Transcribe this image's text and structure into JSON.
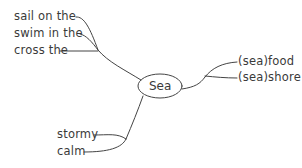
{
  "diagram": {
    "type": "mind-map",
    "center": "Sea",
    "branches": {
      "top_left": [
        "sail on the",
        "swim in the",
        "cross the"
      ],
      "right": [
        "(sea)food",
        "(sea)shore"
      ],
      "bottom_left": [
        "stormy",
        "calm"
      ]
    }
  },
  "colors": {
    "line": "#444444",
    "text": "#3a3a3a",
    "background": "#ffffff"
  }
}
